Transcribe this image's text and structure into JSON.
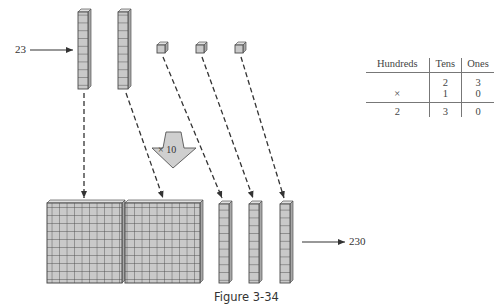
{
  "figure": {
    "caption": "Figure 3-34",
    "input_label": "23",
    "output_label": "230",
    "multiplier_label": "× 10"
  },
  "blocks": {
    "top": {
      "rods": 2,
      "units": 3,
      "rod_length": 10
    },
    "bottom": {
      "flats": 2,
      "rods": 3,
      "flat_size": "10x10",
      "rod_length": 10
    }
  },
  "place_value_table": {
    "headers": [
      "Hundreds",
      "Tens",
      "Ones"
    ],
    "rows": [
      [
        "",
        "2",
        "3"
      ],
      [
        "×",
        "1",
        "0"
      ]
    ],
    "result": [
      "2",
      "3",
      "0"
    ]
  },
  "colors": {
    "block_fill": "#c8c8c8",
    "block_line": "#555555",
    "arrow_fill": "#cfcfcf",
    "line": "#444444"
  }
}
